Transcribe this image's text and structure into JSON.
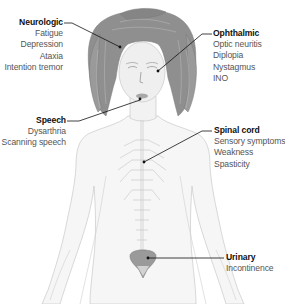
{
  "diagram": {
    "accent_colors": {
      "line": "#111111",
      "hair": "#8e8e8e",
      "skin_outline": "#c8c8c8",
      "bladder": "#8f8f8f",
      "title_text": "#111111",
      "item_text": "#555555"
    },
    "labels": [
      {
        "id": "neurologic",
        "title": "Neurologic",
        "items": [
          "Fatigue",
          "Depression",
          "Ataxia",
          "Intention tremor"
        ]
      },
      {
        "id": "speech",
        "title": "Speech",
        "items": [
          "Dysarthria",
          "Scanning speech"
        ]
      },
      {
        "id": "ophthalmic",
        "title": "Ophthalmic",
        "items": [
          "Optic neuritis",
          "Diplopia",
          "Nystagmus",
          "INO"
        ]
      },
      {
        "id": "spinal_cord",
        "title": "Spinal cord",
        "items": [
          "Sensory symptoms",
          "Weakness",
          "Spasticity"
        ]
      },
      {
        "id": "urinary",
        "title": "Urinary",
        "items": [
          "Incontinence"
        ]
      }
    ]
  }
}
